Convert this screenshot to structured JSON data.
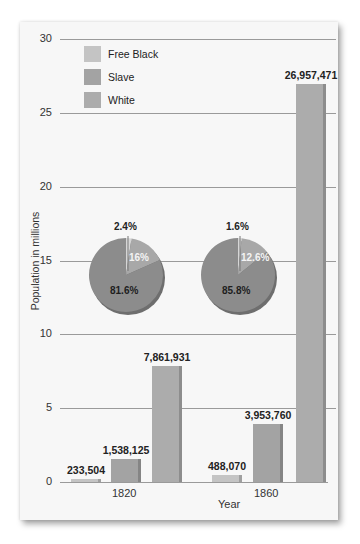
{
  "chart_data": {
    "type": "bar",
    "title": "",
    "xlabel": "Year",
    "ylabel": "Population in millions",
    "ylim": [
      0,
      30
    ],
    "yticks": [
      "0",
      "5",
      "10",
      "15",
      "20",
      "25",
      "30"
    ],
    "grid": true,
    "legend_position": "top-left",
    "categories": [
      "1820",
      "1860"
    ],
    "series": [
      {
        "name": "Free Black",
        "color": "#c4c4c4",
        "values": [
          233504,
          488070
        ],
        "labels": [
          "233,504",
          "488,070"
        ]
      },
      {
        "name": "Slave",
        "color": "#a3a3a3",
        "values": [
          1538125,
          3953760
        ],
        "labels": [
          "1,538,125",
          "3,953,760"
        ]
      },
      {
        "name": "White",
        "color": "#acacac",
        "values": [
          7861931,
          26957471
        ],
        "labels": [
          "7,861,931",
          "26,957,471"
        ]
      }
    ],
    "insets": [
      {
        "type": "pie",
        "year": "1820",
        "slices": [
          {
            "name": "Free Black",
            "value": 2.4,
            "label": "2.4%"
          },
          {
            "name": "Slave",
            "value": 16,
            "label": "16%"
          },
          {
            "name": "White",
            "value": 81.6,
            "label": "81.6%"
          }
        ]
      },
      {
        "type": "pie",
        "year": "1860",
        "slices": [
          {
            "name": "Free Black",
            "value": 1.6,
            "label": "1.6%"
          },
          {
            "name": "Slave",
            "value": 12.6,
            "label": "12.6%"
          },
          {
            "name": "White",
            "value": 85.8,
            "label": "85.8%"
          }
        ]
      }
    ]
  }
}
